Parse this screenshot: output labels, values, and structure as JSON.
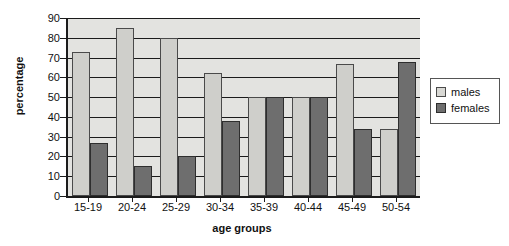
{
  "chart_data": {
    "type": "bar",
    "title": "",
    "xlabel": "age groups",
    "ylabel": "percentage",
    "categories": [
      "15-19",
      "20-24",
      "25-29",
      "30-34",
      "35-39",
      "40-44",
      "45-49",
      "50-54"
    ],
    "series": [
      {
        "name": "males",
        "values": [
          73,
          85,
          80,
          62,
          50,
          50,
          67,
          34
        ],
        "color": "#cfcfcb"
      },
      {
        "name": "females",
        "values": [
          27,
          15,
          20,
          38,
          50,
          50,
          34,
          68
        ],
        "color": "#6e6e6e"
      }
    ],
    "ylim": [
      0,
      90
    ],
    "ytick_labels": [
      "0",
      "10",
      "20",
      "30",
      "40",
      "50",
      "60",
      "70",
      "80",
      "90"
    ],
    "ytick_values": [
      0,
      10,
      20,
      30,
      40,
      50,
      60,
      70,
      80,
      90
    ],
    "grid": true,
    "legend_position": "right",
    "plot_background": "#e3e3e0",
    "axis_color": "#1b1b1b"
  },
  "legend": {
    "items": [
      {
        "label": "males",
        "swatch": "males"
      },
      {
        "label": "females",
        "swatch": "females"
      }
    ]
  }
}
